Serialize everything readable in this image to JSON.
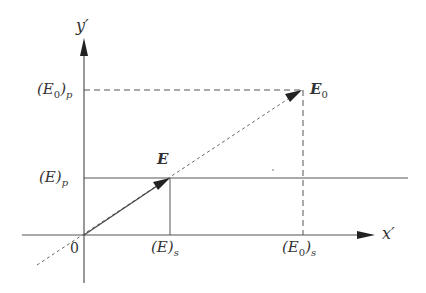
{
  "diagram": {
    "axes": {
      "x_label": "x′",
      "y_label": "y′",
      "origin_label": "0"
    },
    "labels": {
      "E0_p": {
        "base": "(E",
        "sub0": "0",
        "close": ")",
        "sub": "p"
      },
      "E_p": {
        "base": "(E)",
        "sub": "p"
      },
      "E_s": {
        "base": "(E)",
        "sub": "s"
      },
      "E0_s": {
        "base": "(E",
        "sub0": "0",
        "close": ")",
        "sub": "s"
      },
      "E_vector": "E",
      "E0_vector": {
        "base": "E",
        "sub": "0"
      }
    },
    "colors": {
      "line": "#444444",
      "dashed": "#555555",
      "text": "#333333"
    }
  }
}
